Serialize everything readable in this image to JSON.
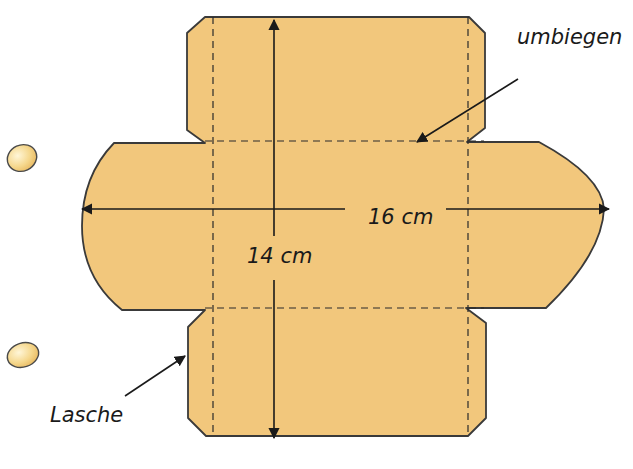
{
  "diagram": {
    "labels": {
      "fold": "umbiegen",
      "width": "16 cm",
      "height": "14 cm",
      "tab": "Lasche"
    },
    "colors": {
      "paper": "#f2c77c",
      "outline": "#3a3a3a",
      "text": "#1a1a1a"
    }
  }
}
